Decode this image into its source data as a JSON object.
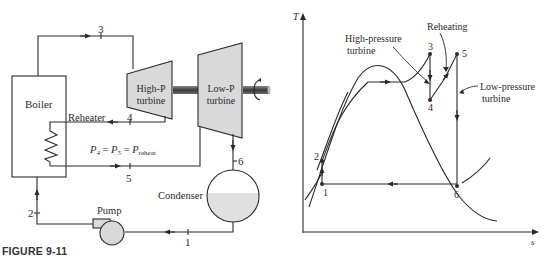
{
  "figure": {
    "caption_label": "FIGURE 9-11"
  },
  "schematic": {
    "components": {
      "boiler": "Boiler",
      "reheater": "Reheater",
      "hp_turbine_line1": "High-P",
      "hp_turbine_line2": "turbine",
      "lp_turbine_line1": "Low-P",
      "lp_turbine_line2": "turbine",
      "condenser": "Condenser",
      "pump": "Pump"
    },
    "states": [
      "1",
      "2",
      "3",
      "4",
      "5",
      "6"
    ],
    "equation": {
      "p": "P",
      "sub4": "4",
      "sub5": "5",
      "subreheat": "reheat",
      "eq": "="
    },
    "colors": {
      "line": "#2a2a2a",
      "fill": "#d9d9d9",
      "shaft": "#555555"
    }
  },
  "ts_diagram": {
    "axis_y": "T",
    "axis_x": "s",
    "annotations": {
      "hp_line1": "High-pressure",
      "hp_line2": "turbine",
      "reheating": "Reheating",
      "lp_line1": "Low-pressure",
      "lp_line2": "turbine"
    },
    "state_labels": {
      "s1": "1",
      "s2": "2",
      "s3": "3",
      "s4": "4",
      "s5": "5",
      "s6": "6"
    }
  }
}
